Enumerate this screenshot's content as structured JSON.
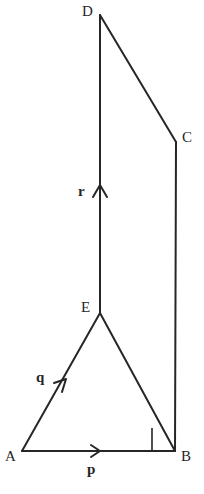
{
  "figure": {
    "type": "geometry-diagram",
    "width": 204,
    "height": 494,
    "background_color": "#ffffff",
    "stroke_color": "#262626",
    "stroke_width": 2,
    "label_color": "#262626"
  },
  "vertices": [
    {
      "id": "A",
      "label": "A",
      "x": 22,
      "y": 451,
      "label_x": 5,
      "label_y": 449
    },
    {
      "id": "B",
      "label": "B",
      "x": 175,
      "y": 451,
      "label_x": 181,
      "label_y": 449
    },
    {
      "id": "C",
      "label": "C",
      "x": 176,
      "y": 142,
      "label_x": 182,
      "label_y": 130
    },
    {
      "id": "D",
      "label": "D",
      "x": 100,
      "y": 15,
      "label_x": 82,
      "label_y": 4
    },
    {
      "id": "E",
      "label": "E",
      "x": 100,
      "y": 313,
      "label_x": 81,
      "label_y": 300
    }
  ],
  "edges": [
    {
      "id": "AB",
      "from": "A",
      "to": "B"
    },
    {
      "id": "AE",
      "from": "A",
      "to": "E"
    },
    {
      "id": "EB",
      "from": "E",
      "to": "B"
    },
    {
      "id": "ED",
      "from": "E",
      "to": "D"
    },
    {
      "id": "DC",
      "from": "D",
      "to": "C"
    },
    {
      "id": "CB",
      "from": "C",
      "to": "B"
    }
  ],
  "vectors": [
    {
      "id": "p",
      "label": "p",
      "on_edge": "AB",
      "direction": "right",
      "arrow_x": 99,
      "arrow_y": 451,
      "label_x": 87,
      "label_y": 462
    },
    {
      "id": "q",
      "label": "q",
      "on_edge": "AE",
      "direction": "up-right",
      "arrow_x": 63,
      "arrow_y": 383,
      "label_x": 36,
      "label_y": 370
    },
    {
      "id": "r",
      "label": "r",
      "on_edge": "ED",
      "direction": "up",
      "arrow_x": 100,
      "arrow_y": 188,
      "label_x": 78,
      "label_y": 184
    }
  ],
  "angle_marks": [
    {
      "id": "right-angle-B",
      "at_vertex": "B",
      "type": "right-angle-square",
      "size": 23,
      "x": 152,
      "y": 428
    }
  ]
}
